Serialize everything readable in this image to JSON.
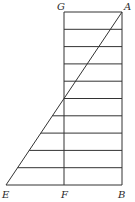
{
  "diagram": {
    "type": "geometric-figure",
    "stroke_color": "#333333",
    "background": "#ffffff",
    "points": {
      "G": {
        "label": "G",
        "x": 64,
        "y": 12,
        "label_x": 57,
        "label_y": 10
      },
      "A": {
        "label": "A",
        "x": 122,
        "y": 12,
        "label_x": 124,
        "label_y": 10
      },
      "E": {
        "label": "E",
        "x": 6,
        "y": 185,
        "label_x": 2,
        "label_y": 198
      },
      "F": {
        "label": "F",
        "x": 64,
        "y": 185,
        "label_x": 61,
        "label_y": 198
      },
      "B": {
        "label": "B",
        "x": 122,
        "y": 185,
        "label_x": 118,
        "label_y": 198
      }
    },
    "segments": [
      {
        "name": "GA",
        "from": "G",
        "to": "A"
      },
      {
        "name": "AB",
        "from": "A",
        "to": "B"
      },
      {
        "name": "GF",
        "from": "G",
        "to": "F"
      },
      {
        "name": "EB",
        "from": "E",
        "to": "B"
      },
      {
        "name": "AE",
        "from": "A",
        "to": "E"
      }
    ],
    "horizontal_divisions": 10
  }
}
